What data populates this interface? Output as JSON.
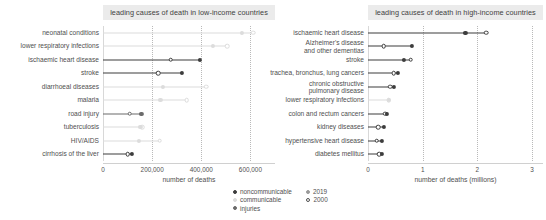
{
  "colors": {
    "noncommunicable": "#3d3d3d",
    "communicable": "#dcdcdc",
    "injuries": "#6b6b6b",
    "grid": "#b9b9b9",
    "title_bg": "#ebebeb",
    "text": "#4f4f4f"
  },
  "legend": {
    "categories": [
      {
        "label": "noncommunicable",
        "color": "#3d3d3d",
        "filled": true
      },
      {
        "label": "communicable",
        "color": "#dcdcdc",
        "filled": true
      },
      {
        "label": "injuries",
        "color": "#6b6b6b",
        "filled": true
      }
    ],
    "years": [
      {
        "label": "2019",
        "marker": "filled"
      },
      {
        "label": "2000",
        "marker": "open"
      }
    ]
  },
  "chart_data": [
    {
      "type": "scatter",
      "id": "low-income",
      "title": "leading causes of death in low-income countries",
      "xlabel": "number of deaths",
      "ylabel": "",
      "xlim": [
        0,
        700000
      ],
      "xticks": [
        0,
        200000,
        400000,
        600000
      ],
      "xticklabels": [
        "0",
        "200,000",
        "400,000",
        "600,000"
      ],
      "grid": true,
      "legend_position": "bottom-center",
      "categories": [
        "neonatal conditions",
        "lower respiratory infections",
        "ischaemic heart disease",
        "stroke",
        "diarrhoeal diseases",
        "malaria",
        "road injury",
        "tuberculosis",
        "HIV/AIDS",
        "cirrhosis of the liver"
      ],
      "series": [
        {
          "name": "2019",
          "values": [
            565000,
            448000,
            395000,
            320000,
            245000,
            234000,
            156000,
            152000,
            145000,
            117000
          ]
        },
        {
          "name": "2000",
          "values": [
            612000,
            505000,
            275000,
            224000,
            420000,
            340000,
            108000,
            160000,
            230000,
            100000
          ]
        }
      ],
      "group": [
        "communicable",
        "communicable",
        "noncommunicable",
        "noncommunicable",
        "communicable",
        "communicable",
        "injuries",
        "communicable",
        "communicable",
        "noncommunicable"
      ]
    },
    {
      "type": "scatter",
      "id": "high-income",
      "title": "leading causes of death in high-income countries",
      "xlabel": "number of deaths (millions)",
      "ylabel": "",
      "xlim": [
        0,
        3.2
      ],
      "xticks": [
        0,
        1,
        2,
        3
      ],
      "xticklabels": [
        "0",
        "1",
        "2",
        "3"
      ],
      "grid": true,
      "legend_position": "bottom-center",
      "categories": [
        "ischaemic heart disease",
        "Alzheimer's disease\nand other dementias",
        "stroke",
        "trachea, bronchus, lung cancers",
        "chronic obstructive\npulmonary disease",
        "lower respiratory infections",
        "colon and rectum cancers",
        "kidney diseases",
        "hypertensive heart disease",
        "diabetes mellitus"
      ],
      "series": [
        {
          "name": "2019",
          "values": [
            1.78,
            0.81,
            0.66,
            0.54,
            0.48,
            0.38,
            0.34,
            0.29,
            0.26,
            0.25
          ]
        },
        {
          "name": "2000",
          "values": [
            2.16,
            0.29,
            0.78,
            0.47,
            0.41,
            0.38,
            0.31,
            0.19,
            0.16,
            0.21
          ]
        }
      ],
      "group": [
        "noncommunicable",
        "noncommunicable",
        "noncommunicable",
        "noncommunicable",
        "noncommunicable",
        "communicable",
        "noncommunicable",
        "noncommunicable",
        "noncommunicable",
        "noncommunicable"
      ]
    }
  ]
}
